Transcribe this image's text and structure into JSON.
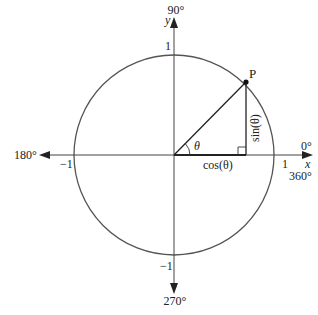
{
  "diagram": {
    "axes": {
      "x_label": "x",
      "y_label": "y",
      "x_pos_tick": "1",
      "x_neg_tick": "−1",
      "y_pos_tick": "1",
      "y_neg_tick": "−1"
    },
    "angles": {
      "deg_0": "0°",
      "deg_90": "90°",
      "deg_180": "180°",
      "deg_270": "270°",
      "deg_360": "360°"
    },
    "point_label": "P",
    "theta_label": "θ",
    "sin_label": "sin(θ)",
    "cos_label": "cos(θ)",
    "colors": {
      "circle": "#555555",
      "axes": "#444444",
      "lines": "#222222"
    }
  }
}
